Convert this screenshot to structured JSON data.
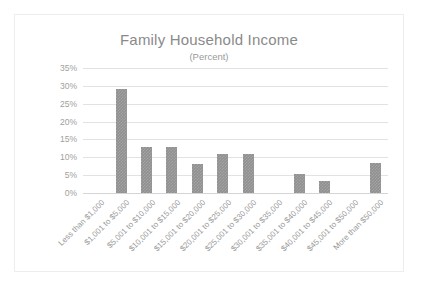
{
  "chart_data": {
    "type": "bar",
    "title": "Family Household Income",
    "subtitle": "(Percent)",
    "xlabel": "",
    "ylabel": "",
    "ylim": [
      0,
      35
    ],
    "ytick_labels": [
      "35%",
      "30%",
      "25%",
      "20%",
      "15%",
      "10%",
      "5%",
      "0%"
    ],
    "ytick_values": [
      35,
      30,
      25,
      20,
      15,
      10,
      5,
      0
    ],
    "grid": true,
    "legend": false,
    "categories": [
      "Less than $1,000",
      "$1,001 to $5,000",
      "$5,001 to $10,000",
      "$10,001 to $15,000",
      "$15,001 to $20,000",
      "$20,001 to $25,000",
      "$25,001 to $30,000",
      "$30,001 to $35,000",
      "$35,001 to $40,000",
      "$40,001 to $45,000",
      "$45,001 to $50,000",
      "More than $50,000"
    ],
    "values": [
      0,
      29,
      13,
      13,
      8,
      11,
      11,
      0,
      5.4,
      3.4,
      0,
      8.5
    ],
    "colors": {
      "bar": "#909090",
      "gridline": "#e2e2e2",
      "axis_text": "#a0a0a0",
      "title_text": "#8a8a8a",
      "border": "#ededed",
      "background": "#ffffff"
    }
  }
}
